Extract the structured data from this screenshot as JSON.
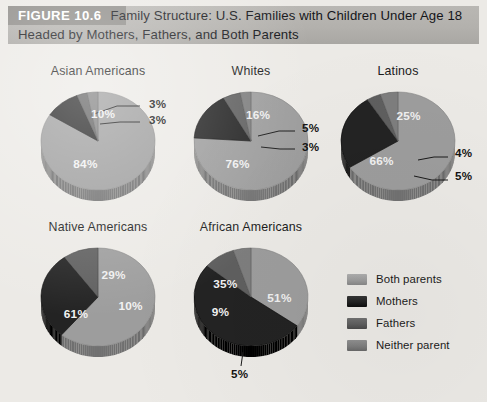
{
  "figure": {
    "tag": "FIGURE 10.6",
    "title": "Family Structure: U.S. Families with Children Under Age 18 Headed by Mothers, Fathers, and Both Parents"
  },
  "legend": {
    "items": [
      {
        "label": "Both parents",
        "color": "#9d9d9d"
      },
      {
        "label": "Mothers",
        "color": "#232323"
      },
      {
        "label": "Fathers",
        "color": "#5f5f5f"
      },
      {
        "label": "Neither parent",
        "color": "#7e7e7e"
      }
    ]
  },
  "chart_data": {
    "type": "pie",
    "title": "Family Structure: U.S. Families with Children Under Age 18 Headed by Mothers, Fathers, and Both Parents",
    "categories": [
      "Both parents",
      "Mothers",
      "Fathers",
      "Neither parent"
    ],
    "colors": [
      "#9d9d9d",
      "#232323",
      "#5f5f5f",
      "#7e7e7e"
    ],
    "unit": "percent",
    "legend_position": "right",
    "grid": false,
    "charts": [
      {
        "name": "Asian Americans",
        "values": [
          84,
          10,
          3,
          3
        ],
        "labels": [
          "84%",
          "10%",
          "3%",
          "3%"
        ]
      },
      {
        "name": "Whites",
        "values": [
          76,
          16,
          5,
          3
        ],
        "labels": [
          "76%",
          "16%",
          "5%",
          "3%"
        ]
      },
      {
        "name": "Latinos",
        "values": [
          66,
          25,
          4,
          5
        ],
        "labels": [
          "66%",
          "25%",
          "4%",
          "5%"
        ]
      },
      {
        "name": "Native Americans",
        "values": [
          61,
          29,
          10,
          0
        ],
        "labels": [
          "61%",
          "29%",
          "10%",
          ""
        ]
      },
      {
        "name": "African Americans",
        "values": [
          35,
          51,
          9,
          5
        ],
        "labels": [
          "35%",
          "51%",
          "9%",
          "5%"
        ]
      }
    ]
  },
  "charts_meta": [
    {
      "title": "Asian Americans",
      "x": 22,
      "y": 64,
      "w": 152,
      "r": 57
    },
    {
      "title": "Whites",
      "x": 175,
      "y": 64,
      "w": 152,
      "r": 57
    },
    {
      "title": "Latinos",
      "x": 322,
      "y": 64,
      "w": 152,
      "r": 57
    },
    {
      "title": "Native Americans",
      "x": 22,
      "y": 220,
      "w": 152,
      "r": 57
    },
    {
      "title": "African Americans",
      "x": 175,
      "y": 220,
      "w": 152,
      "r": 57
    }
  ]
}
